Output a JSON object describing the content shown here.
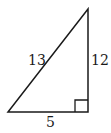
{
  "diagram": {
    "type": "right-triangle",
    "vertices": {
      "top": [
        88,
        9
      ],
      "bottom_left": [
        8,
        112
      ],
      "bottom_right": [
        88,
        112
      ]
    },
    "right_angle_at": "bottom_right",
    "labels": {
      "hypotenuse": "13",
      "vertical_leg": "12",
      "base": "5"
    },
    "stroke_color": "#1a1a1a"
  }
}
